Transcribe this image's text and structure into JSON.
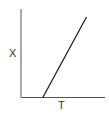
{
  "chart_data": {
    "type": "line",
    "title": "",
    "xlabel": "T",
    "ylabel": "X",
    "grid": false,
    "legend": null,
    "xlim": [
      0,
      1
    ],
    "ylim": [
      0,
      1
    ],
    "x_ticks": [],
    "y_ticks": [],
    "series": [
      {
        "name": "X vs T",
        "x": [
          0.26,
          0.78
        ],
        "y": [
          0.0,
          0.91
        ]
      }
    ],
    "annotations": []
  },
  "colors": {
    "axis": "#555555",
    "line": "#222222",
    "background": "#ffffff",
    "label": "#333333"
  }
}
